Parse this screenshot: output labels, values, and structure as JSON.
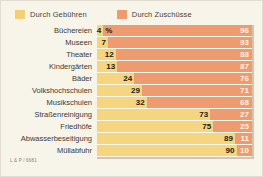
{
  "legend": {
    "items": [
      {
        "label": "Durch Gebühren",
        "color": "#f3d076",
        "key": "fees"
      },
      {
        "label": "Durch Zuschüsse",
        "color": "#ef9b70",
        "key": "subsidies"
      }
    ]
  },
  "credit": {
    "text": "L & P / 6681"
  },
  "units": {
    "percent_mark": "%"
  },
  "chart_data": {
    "type": "bar",
    "orientation": "horizontal",
    "stacked": true,
    "title": "",
    "subtitle": "",
    "xlabel": "",
    "ylabel": "",
    "xlim": [
      0,
      100
    ],
    "grid": false,
    "legend_position": "top-left",
    "value_unit": "%",
    "categories": [
      "Büchereien",
      "Museen",
      "Theater",
      "Kindergärten",
      "Bäder",
      "Volkshochschulen",
      "Musikschulen",
      "Straßenreinigung",
      "Friedhöfe",
      "Abwasserbeseitigung",
      "Müllabfuhr"
    ],
    "series": [
      {
        "name": "Durch Gebühren",
        "color": "#f5d580",
        "values": [
          4,
          7,
          12,
          13,
          24,
          29,
          32,
          73,
          75,
          89,
          90
        ]
      },
      {
        "name": "Durch Zuschüsse",
        "color": "#ef9b70",
        "values": [
          96,
          93,
          88,
          87,
          76,
          71,
          68,
          27,
          25,
          11,
          10
        ]
      }
    ],
    "rows": [
      {
        "label": "Büchereien",
        "fees": 4,
        "subsidies": 96,
        "fees_text": "4",
        "subsidies_text": "96",
        "show_percent": true
      },
      {
        "label": "Museen",
        "fees": 7,
        "subsidies": 93,
        "fees_text": "7",
        "subsidies_text": "93",
        "show_percent": false
      },
      {
        "label": "Theater",
        "fees": 12,
        "subsidies": 88,
        "fees_text": "12",
        "subsidies_text": "88",
        "show_percent": false
      },
      {
        "label": "Kindergärten",
        "fees": 13,
        "subsidies": 87,
        "fees_text": "13",
        "subsidies_text": "87",
        "show_percent": false
      },
      {
        "label": "Bäder",
        "fees": 24,
        "subsidies": 76,
        "fees_text": "24",
        "subsidies_text": "76",
        "show_percent": false
      },
      {
        "label": "Volkshochschulen",
        "fees": 29,
        "subsidies": 71,
        "fees_text": "29",
        "subsidies_text": "71",
        "show_percent": false
      },
      {
        "label": "Musikschulen",
        "fees": 32,
        "subsidies": 68,
        "fees_text": "32",
        "subsidies_text": "68",
        "show_percent": false
      },
      {
        "label": "Straßenreinigung",
        "fees": 73,
        "subsidies": 27,
        "fees_text": "73",
        "subsidies_text": "27",
        "show_percent": false
      },
      {
        "label": "Friedhöfe",
        "fees": 75,
        "subsidies": 25,
        "fees_text": "75",
        "subsidies_text": "25",
        "show_percent": false
      },
      {
        "label": "Abwasserbeseitigung",
        "fees": 89,
        "subsidies": 11,
        "fees_text": "89",
        "subsidies_text": "11",
        "show_percent": false
      },
      {
        "label": "Müllabfuhr",
        "fees": 90,
        "subsidies": 10,
        "fees_text": "90",
        "subsidies_text": "10",
        "show_percent": false
      }
    ]
  }
}
